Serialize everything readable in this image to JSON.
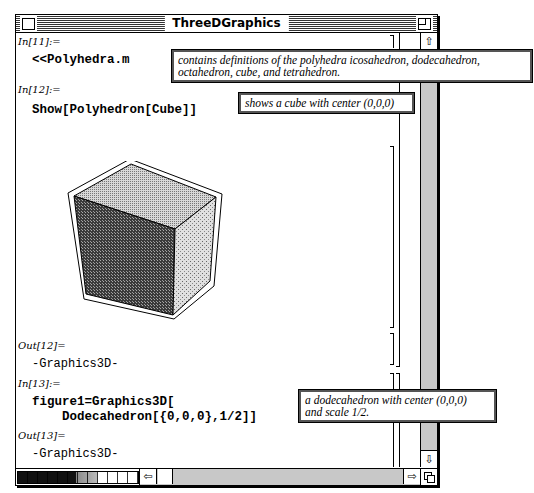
{
  "window": {
    "title": "ThreeDGraphics"
  },
  "cells": [
    {
      "label": "In[11]:=",
      "code": "<<Polyhedra.m"
    },
    {
      "label": "In[12]:=",
      "code": "Show[Polyhedron[Cube]]"
    },
    {
      "label": "Out[12]=",
      "output": "-Graphics3D-"
    },
    {
      "label": "In[13]:=",
      "code_line1": "figure1=Graphics3D[",
      "code_line2": "    Dodecahedron[{0,0,0},1/2]]"
    },
    {
      "label": "Out[13]=",
      "output": "-Graphics3D-"
    }
  ],
  "annotations": {
    "polyhedra": {
      "line1": "contains definitions of the polyhedra  icosahedron, dodecahedron,",
      "line2": "octahedron, cube, and tetrahedron."
    },
    "cube": "shows a cube with center (0,0,0)",
    "dodecahedron": {
      "line1": "a dodecahedron with center (0,0,0)",
      "line2": "and scale 1/2."
    }
  },
  "graphic": {
    "name": "cube",
    "colors": {
      "top": "#b8b8b8",
      "front": "#555555",
      "right": "#c8c8c8"
    }
  },
  "scrollbars": {
    "up_arrow": "⇧",
    "down_arrow": "⇩",
    "left_arrow": "⇦",
    "right_arrow": "⇨"
  }
}
